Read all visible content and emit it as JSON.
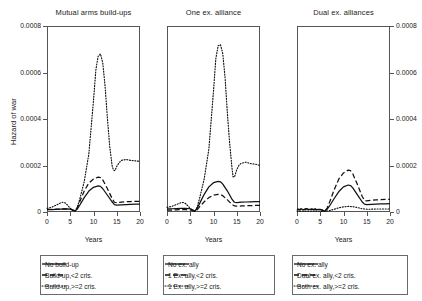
{
  "figure": {
    "ylabel": "Hazard of war",
    "xlabel": "Years"
  },
  "chart_data": {
    "type": "line",
    "title": "",
    "xlabel": "Years",
    "ylabel": "Hazard of war",
    "xlim": [
      0,
      20
    ],
    "ylim": [
      0,
      0.0008
    ],
    "xticks": [
      0,
      5,
      10,
      15,
      20
    ],
    "xtick_labels": [
      "0",
      "5",
      "10",
      "15",
      "20"
    ],
    "yticks": [
      0,
      0.0002,
      0.0004,
      0.0006,
      0.0008
    ],
    "ytick_labels": [
      "0",
      "0.0002",
      "0.0004",
      "0.0006",
      "0.0008"
    ],
    "grid": false,
    "legend_position": "below-panel",
    "panels": [
      {
        "title": "Mutual arms build-ups",
        "y_axis_side": "left",
        "legend": [
          {
            "label": "No build-up",
            "style": "solid"
          },
          {
            "label": "Build-up,<2 cris.",
            "style": "dashed"
          },
          {
            "label": "Build-up,>=2 cris.",
            "style": "dotted"
          }
        ],
        "series": [
          {
            "name": "No build-up",
            "style": "solid",
            "x": [
              0,
              1,
              2,
              3,
              4,
              5,
              5.5,
              6,
              6.5,
              7,
              8,
              9,
              10,
              11,
              11.5,
              12,
              13,
              14,
              14.5,
              15,
              16,
              17,
              18,
              19,
              20
            ],
            "values": [
              1e-05,
              1e-05,
              1.1e-05,
              1.2e-05,
              1.3e-05,
              1.2e-05,
              8e-06,
              4e-06,
              1.2e-05,
              2.8e-05,
              6.2e-05,
              9e-05,
              0.000106,
              0.000112,
              0.00011,
              0.0001,
              7.2e-05,
              4.4e-05,
              3.2e-05,
              3e-05,
              3.1e-05,
              3.2e-05,
              3.3e-05,
              3.4e-05,
              3.4e-05
            ]
          },
          {
            "name": "Build-up,<2 cris.",
            "style": "dashed",
            "x": [
              0,
              1,
              2,
              3,
              4,
              5,
              5.5,
              6,
              6.5,
              7,
              8,
              9,
              10,
              11,
              11.5,
              12,
              13,
              14,
              14.5,
              15,
              16,
              17,
              18,
              19,
              20
            ],
            "values": [
              1.1e-05,
              1.1e-05,
              1.2e-05,
              1.3e-05,
              1.4e-05,
              1.3e-05,
              9e-06,
              5e-06,
              1.8e-05,
              4.2e-05,
              9e-05,
              0.000125,
              0.000142,
              0.00015,
              0.000148,
              0.000138,
              0.0001,
              5.8e-05,
              4.2e-05,
              4e-05,
              4.2e-05,
              4.4e-05,
              4.5e-05,
              4.6e-05,
              4.6e-05
            ]
          },
          {
            "name": "Build-up,>=2 cris.",
            "style": "dotted",
            "x": [
              0,
              1,
              2,
              3,
              3.5,
              4,
              4.5,
              5,
              5.5,
              6,
              6.5,
              7,
              8,
              9,
              10,
              10.5,
              11,
              11.5,
              12,
              12.5,
              13,
              13.5,
              14,
              14.3,
              14.6,
              15,
              15.5,
              16,
              17,
              18,
              19,
              20
            ],
            "values": [
              1.6e-05,
              2e-05,
              3e-05,
              4e-05,
              4.2e-05,
              3.8e-05,
              2.8e-05,
              1.6e-05,
              8e-06,
              4e-06,
              2e-05,
              5.2e-05,
              0.00013,
              0.00025,
              0.00048,
              0.00061,
              0.00067,
              0.00068,
              0.00064,
              0.00054,
              0.0004,
              0.00028,
              0.0002,
              0.00018,
              0.000178,
              0.000196,
              0.000212,
              0.000222,
              0.000226,
              0.000222,
              0.00022,
              0.000218
            ]
          }
        ]
      },
      {
        "title": "One ex. alliance",
        "y_axis_side": "none",
        "legend": [
          {
            "label": "No ex. ally",
            "style": "solid"
          },
          {
            "label": "1 Ex. ally,<2 cris.",
            "style": "dashed"
          },
          {
            "label": "1 Ex. ally,>=2 cris.",
            "style": "dotted"
          }
        ],
        "series": [
          {
            "name": "No ex. ally",
            "style": "solid",
            "x": [
              0,
              1,
              2,
              3,
              4,
              5,
              5.5,
              6,
              6.5,
              7,
              8,
              9,
              10,
              11,
              11.5,
              12,
              13,
              14,
              14.5,
              15,
              16,
              17,
              18,
              19,
              20
            ],
            "values": [
              1.4e-05,
              1.4e-05,
              1.5e-05,
              1.6e-05,
              1.6e-05,
              1.4e-05,
              9e-06,
              4e-06,
              1.6e-05,
              3.6e-05,
              7.6e-05,
              0.000108,
              0.000126,
              0.000132,
              0.00013,
              0.00012,
              9e-05,
              5.4e-05,
              4.2e-05,
              4e-05,
              4.2e-05,
              4.3e-05,
              4.4e-05,
              4.5e-05,
              4.5e-05
            ]
          },
          {
            "name": "1 Ex. ally,<2 cris.",
            "style": "dashed",
            "x": [
              0,
              1,
              2,
              3,
              4,
              5,
              5.5,
              6,
              6.5,
              7,
              8,
              9,
              10,
              11,
              11.5,
              12,
              13,
              14,
              14.5,
              15,
              16,
              17,
              18,
              19,
              20
            ],
            "values": [
              8e-06,
              8e-06,
              9e-06,
              1e-05,
              1e-05,
              9e-06,
              6e-06,
              3e-06,
              1e-05,
              2.2e-05,
              4.4e-05,
              6.2e-05,
              7.2e-05,
              7.6e-05,
              7.5e-05,
              7e-05,
              5.2e-05,
              3.2e-05,
              2.6e-05,
              2.5e-05,
              2.6e-05,
              2.7e-05,
              2.7e-05,
              2.8e-05,
              2.8e-05
            ]
          },
          {
            "name": "1 Ex. ally,>=2 cris.",
            "style": "dotted",
            "x": [
              0,
              1,
              2,
              3,
              3.5,
              4,
              4.5,
              5,
              5.5,
              6,
              6.5,
              7,
              8,
              9,
              10,
              10.5,
              11,
              11.5,
              12,
              12.5,
              13,
              13.5,
              14,
              14.2,
              14.5,
              15,
              15.5,
              16,
              17,
              18,
              19,
              20
            ],
            "values": [
              2e-05,
              2.4e-05,
              3.2e-05,
              4e-05,
              4.1e-05,
              3.6e-05,
              2.6e-05,
              1.5e-05,
              7e-06,
              3e-06,
              2.2e-05,
              5.8e-05,
              0.000142,
              0.00027,
              0.00052,
              0.00066,
              0.000715,
              0.00072,
              0.00068,
              0.000575,
              0.00042,
              0.00029,
              0.000185,
              0.000152,
              0.00015,
              0.000182,
              0.000202,
              0.00021,
              0.000214,
              0.000208,
              0.000206,
              0.0002
            ]
          }
        ]
      },
      {
        "title": "Dual ex. alliances",
        "y_axis_side": "right",
        "legend": [
          {
            "label": "No ex. ally",
            "style": "solid"
          },
          {
            "label": "Dual ex. ally,<2 cris.",
            "style": "dashed"
          },
          {
            "label": "Both ex. ally,>=2 cris.",
            "style": "dotted"
          }
        ],
        "series": [
          {
            "name": "No ex. ally",
            "style": "solid",
            "x": [
              0,
              0.5,
              1,
              1.5,
              2,
              2.5,
              3,
              3.5,
              4,
              5,
              5.5,
              6,
              6.5,
              7,
              8,
              9,
              10,
              11,
              11.5,
              12,
              13,
              14,
              14.5,
              15,
              16,
              17,
              18,
              19,
              20
            ],
            "values": [
              1.2e-05,
              9e-06,
              1.3e-05,
              9e-06,
              1.3e-05,
              1e-05,
              1.2e-05,
              1e-05,
              1.1e-05,
              1e-05,
              7e-06,
              4e-06,
              1.2e-05,
              2.6e-05,
              5.8e-05,
              8.8e-05,
              0.000108,
              0.000116,
              0.000114,
              0.000104,
              7.4e-05,
              4.4e-05,
              3.4e-05,
              3.2e-05,
              3.3e-05,
              3.4e-05,
              3.5e-05,
              3.5e-05,
              3.6e-05
            ]
          },
          {
            "name": "Dual ex. ally,<2 cris.",
            "style": "dashed",
            "x": [
              0,
              0.5,
              1,
              1.5,
              2,
              2.5,
              3,
              3.5,
              4,
              5,
              5.5,
              6,
              6.5,
              7,
              8,
              9,
              10,
              11,
              11.5,
              12,
              13,
              14,
              14.5,
              15,
              16,
              17,
              18,
              19,
              20
            ],
            "values": [
              1.4e-05,
              1e-05,
              1.5e-05,
              1.1e-05,
              1.5e-05,
              1.1e-05,
              1.4e-05,
              1.1e-05,
              1.3e-05,
              1.1e-05,
              8e-06,
              4e-06,
              1.8e-05,
              4.2e-05,
              9.6e-05,
              0.000142,
              0.000168,
              0.00018,
              0.000178,
              0.000164,
              0.000118,
              6.8e-05,
              5e-05,
              4.8e-05,
              5e-05,
              5.2e-05,
              5.3e-05,
              5.4e-05,
              5.4e-05
            ]
          },
          {
            "name": "Both ex. ally,>=2 cris.",
            "style": "dotted",
            "x": [
              0,
              1,
              2,
              3,
              4,
              5,
              6,
              7,
              8,
              9,
              10,
              11,
              12,
              13,
              14,
              15,
              16,
              17,
              18,
              19,
              20
            ],
            "values": [
              4e-06,
              4e-06,
              4e-06,
              4e-06,
              4e-06,
              3e-06,
              2e-06,
              6e-06,
              1.2e-05,
              1.8e-05,
              2.2e-05,
              2.4e-05,
              2.3e-05,
              1.9e-05,
              1.4e-05,
              1.2e-05,
              1.2e-05,
              1.3e-05,
              1.3e-05,
              1.3e-05,
              1.3e-05
            ]
          }
        ]
      }
    ]
  }
}
